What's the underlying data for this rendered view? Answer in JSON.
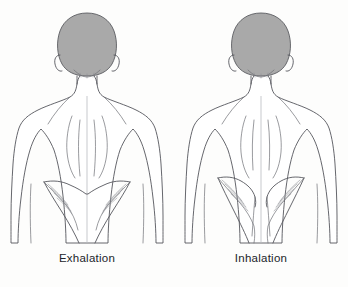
{
  "figure": {
    "background_color": "#fdfdfc",
    "outline_color": "#4a4a4a",
    "hair_fill_color": "#a9a9a9",
    "hair_outline_color": "#555555",
    "caption_color": "#22242a"
  },
  "panels": [
    {
      "id": "exhalation",
      "label": "Exhalation",
      "side": "left",
      "subject": "human-back-torso",
      "view": "posterior",
      "highlighted_region": "latissimus-dorsi",
      "muscle_state": "relaxed-lowered"
    },
    {
      "id": "inhalation",
      "label": "Inhalation",
      "side": "right",
      "subject": "human-back-torso",
      "view": "posterior",
      "highlighted_region": "latissimus-dorsi",
      "muscle_state": "contracted-raised"
    }
  ],
  "captions": {
    "left": "Exhalation",
    "right": "Inhalation"
  }
}
